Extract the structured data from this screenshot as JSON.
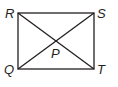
{
  "diagram": {
    "type": "rectangle-with-diagonals",
    "vertices": [
      {
        "label": "R",
        "x": 18,
        "y": 13
      },
      {
        "label": "S",
        "x": 94,
        "y": 13
      },
      {
        "label": "T",
        "x": 94,
        "y": 69
      },
      {
        "label": "Q",
        "x": 18,
        "y": 69
      }
    ],
    "intersection": {
      "label": "P"
    },
    "stroke_color": "#231f20"
  }
}
